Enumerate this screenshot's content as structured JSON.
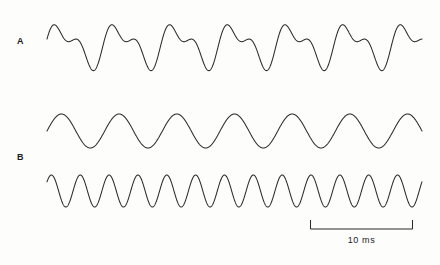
{
  "figure": {
    "background_color": "#fdfdfc",
    "line_color": "#2b2b2b",
    "width": 440,
    "height": 265
  },
  "labels": {
    "trace_a": "A",
    "trace_b": "B"
  },
  "scalebar": {
    "label": "10 ms",
    "length_px": 103,
    "value": 10,
    "unit": "ms"
  },
  "chart_data": {
    "type": "line",
    "title": "",
    "xlabel": "",
    "ylabel": "",
    "grid": false,
    "legend": "none",
    "x_axis": {
      "unit": "ms",
      "scalebar_value": 10,
      "scalebar_label": "10 ms",
      "total_span_ms": 36.4,
      "range_px": [
        47,
        422
      ]
    },
    "traces": [
      {
        "name": "A",
        "label": "A",
        "description": "Complex periodic waveform: sum of fundamental and second harmonic components",
        "row": 1,
        "baseline_y_px": 45,
        "amplitude_px": 27,
        "cycles_visible": 6.5,
        "fundamental_period_ms": 5.6,
        "components": [
          {
            "harmonic": 1,
            "relative_amplitude": 1.0,
            "phase_deg": 0
          },
          {
            "harmonic": 2,
            "relative_amplitude": 0.62,
            "phase_deg": 35
          }
        ],
        "y_range_px": [
          13,
          70
        ]
      },
      {
        "name": "B-fundamental",
        "label": "B",
        "description": "Pure sinusoid, fundamental frequency component",
        "row": 2,
        "baseline_y_px": 131,
        "amplitude_px": 17,
        "cycles_visible": 6.5,
        "period_ms": 5.6,
        "y_range_px": [
          114,
          149
        ]
      },
      {
        "name": "B-harmonic",
        "label": "B",
        "description": "Pure sinusoid, second harmonic, twice the fundamental frequency",
        "row": 3,
        "baseline_y_px": 191,
        "amplitude_px": 16,
        "cycles_visible": 13,
        "period_ms": 2.8,
        "y_range_px": [
          175,
          207
        ]
      }
    ]
  }
}
